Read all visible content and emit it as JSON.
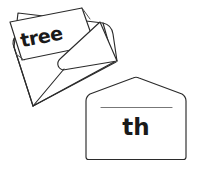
{
  "scene": {
    "title": "Envelopes phonics illustration",
    "width": 199,
    "height": 173,
    "background_color": "#ffffff",
    "ink_color": "#2b2b2b",
    "accent_line_color": "#777777"
  },
  "open_envelope": {
    "name": "open envelope with card",
    "description": "Tilted open envelope with a rectangular card sticking out of the top",
    "card_text": "tree"
  },
  "closed_envelope": {
    "name": "closed envelope",
    "description": "Upright closed envelope with a peaked flap and a ruled line",
    "label_text": "th"
  }
}
